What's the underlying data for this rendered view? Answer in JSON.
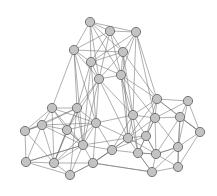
{
  "figure": {
    "kind": "node-link-graph",
    "title": "",
    "background_color": "#ffffff",
    "width": 217,
    "height": 196
  },
  "style": {
    "node_fill": "#c3c3c3",
    "node_stroke": "#6a6a6a",
    "node_radius": 4.6,
    "node_stroke_width": 0.9,
    "edge_color": "#6e6e6e",
    "edge_width": 0.55
  },
  "chart_data": {
    "type": "scatter",
    "title": "",
    "xlabel": "",
    "ylabel": "",
    "grid": false,
    "legend": "none",
    "xlim": [
      0,
      217
    ],
    "ylim": [
      0,
      196
    ],
    "node_count": 33,
    "edge_count": 128,
    "nodes": [
      {
        "id": 0,
        "x": 90,
        "y": 22
      },
      {
        "id": 1,
        "x": 110,
        "y": 31
      },
      {
        "id": 2,
        "x": 136,
        "y": 32
      },
      {
        "id": 3,
        "x": 74,
        "y": 50
      },
      {
        "id": 4,
        "x": 123,
        "y": 52
      },
      {
        "id": 5,
        "x": 91,
        "y": 62
      },
      {
        "id": 6,
        "x": 121,
        "y": 75
      },
      {
        "id": 7,
        "x": 99,
        "y": 79
      },
      {
        "id": 8,
        "x": 157,
        "y": 99
      },
      {
        "id": 9,
        "x": 188,
        "y": 101
      },
      {
        "id": 10,
        "x": 52,
        "y": 108
      },
      {
        "id": 11,
        "x": 77,
        "y": 108
      },
      {
        "id": 12,
        "x": 133,
        "y": 115
      },
      {
        "id": 13,
        "x": 180,
        "y": 117
      },
      {
        "id": 14,
        "x": 155,
        "y": 118
      },
      {
        "id": 15,
        "x": 42,
        "y": 125
      },
      {
        "id": 16,
        "x": 25,
        "y": 131
      },
      {
        "id": 17,
        "x": 96,
        "y": 123
      },
      {
        "id": 18,
        "x": 200,
        "y": 132
      },
      {
        "id": 19,
        "x": 128,
        "y": 138
      },
      {
        "id": 20,
        "x": 83,
        "y": 145
      },
      {
        "id": 21,
        "x": 156,
        "y": 154
      },
      {
        "id": 22,
        "x": 138,
        "y": 153
      },
      {
        "id": 23,
        "x": 178,
        "y": 147
      },
      {
        "id": 24,
        "x": 26,
        "y": 162
      },
      {
        "id": 25,
        "x": 54,
        "y": 163
      },
      {
        "id": 26,
        "x": 93,
        "y": 163
      },
      {
        "id": 27,
        "x": 70,
        "y": 175
      },
      {
        "id": 28,
        "x": 152,
        "y": 172
      },
      {
        "id": 29,
        "x": 178,
        "y": 167
      },
      {
        "id": 30,
        "x": 112,
        "y": 150
      },
      {
        "id": 31,
        "x": 67,
        "y": 130
      },
      {
        "id": 32,
        "x": 146,
        "y": 136
      }
    ],
    "edges": [
      [
        0,
        1
      ],
      [
        0,
        2
      ],
      [
        0,
        3
      ],
      [
        0,
        4
      ],
      [
        0,
        5
      ],
      [
        0,
        7
      ],
      [
        0,
        6
      ],
      [
        1,
        2
      ],
      [
        1,
        3
      ],
      [
        1,
        4
      ],
      [
        1,
        5
      ],
      [
        1,
        6
      ],
      [
        1,
        7
      ],
      [
        2,
        4
      ],
      [
        2,
        5
      ],
      [
        2,
        6
      ],
      [
        2,
        8
      ],
      [
        2,
        12
      ],
      [
        2,
        14
      ],
      [
        3,
        4
      ],
      [
        3,
        5
      ],
      [
        3,
        7
      ],
      [
        3,
        10
      ],
      [
        3,
        11
      ],
      [
        3,
        17
      ],
      [
        3,
        20
      ],
      [
        4,
        5
      ],
      [
        4,
        6
      ],
      [
        4,
        7
      ],
      [
        4,
        8
      ],
      [
        4,
        12
      ],
      [
        4,
        19
      ],
      [
        5,
        6
      ],
      [
        5,
        7
      ],
      [
        5,
        11
      ],
      [
        5,
        17
      ],
      [
        5,
        20
      ],
      [
        6,
        7
      ],
      [
        6,
        8
      ],
      [
        6,
        12
      ],
      [
        6,
        14
      ],
      [
        6,
        19
      ],
      [
        6,
        22
      ],
      [
        7,
        11
      ],
      [
        7,
        12
      ],
      [
        7,
        17
      ],
      [
        7,
        19
      ],
      [
        7,
        20
      ],
      [
        7,
        31
      ],
      [
        8,
        9
      ],
      [
        8,
        12
      ],
      [
        8,
        13
      ],
      [
        8,
        14
      ],
      [
        8,
        18
      ],
      [
        8,
        19
      ],
      [
        8,
        32
      ],
      [
        9,
        13
      ],
      [
        9,
        14
      ],
      [
        9,
        18
      ],
      [
        9,
        23
      ],
      [
        10,
        11
      ],
      [
        10,
        15
      ],
      [
        10,
        16
      ],
      [
        10,
        17
      ],
      [
        10,
        31
      ],
      [
        10,
        25
      ],
      [
        10,
        20
      ],
      [
        11,
        15
      ],
      [
        11,
        16
      ],
      [
        11,
        17
      ],
      [
        11,
        31
      ],
      [
        11,
        20
      ],
      [
        11,
        25
      ],
      [
        11,
        27
      ],
      [
        12,
        14
      ],
      [
        12,
        19
      ],
      [
        12,
        22
      ],
      [
        12,
        30
      ],
      [
        12,
        32
      ],
      [
        12,
        17
      ],
      [
        13,
        14
      ],
      [
        13,
        18
      ],
      [
        13,
        23
      ],
      [
        13,
        21
      ],
      [
        13,
        29
      ],
      [
        14,
        19
      ],
      [
        14,
        21
      ],
      [
        14,
        22
      ],
      [
        14,
        23
      ],
      [
        14,
        32
      ],
      [
        15,
        16
      ],
      [
        15,
        31
      ],
      [
        15,
        24
      ],
      [
        15,
        25
      ],
      [
        15,
        20
      ],
      [
        15,
        17
      ],
      [
        16,
        24
      ],
      [
        16,
        25
      ],
      [
        16,
        15
      ],
      [
        17,
        20
      ],
      [
        17,
        31
      ],
      [
        17,
        26
      ],
      [
        17,
        25
      ],
      [
        17,
        30
      ],
      [
        17,
        19
      ],
      [
        18,
        23
      ],
      [
        18,
        29
      ],
      [
        18,
        13
      ],
      [
        19,
        22
      ],
      [
        19,
        30
      ],
      [
        19,
        32
      ],
      [
        19,
        21
      ],
      [
        19,
        26
      ],
      [
        19,
        20
      ],
      [
        20,
        25
      ],
      [
        20,
        26
      ],
      [
        20,
        27
      ],
      [
        20,
        31
      ],
      [
        20,
        24
      ],
      [
        20,
        30
      ],
      [
        21,
        22
      ],
      [
        21,
        23
      ],
      [
        21,
        28
      ],
      [
        21,
        29
      ],
      [
        21,
        32
      ],
      [
        22,
        28
      ],
      [
        22,
        30
      ],
      [
        22,
        32
      ],
      [
        22,
        21
      ],
      [
        23,
        29
      ],
      [
        23,
        28
      ],
      [
        23,
        21
      ],
      [
        24,
        25
      ],
      [
        24,
        27
      ],
      [
        24,
        20
      ],
      [
        25,
        27
      ],
      [
        25,
        26
      ],
      [
        25,
        31
      ],
      [
        26,
        27
      ],
      [
        26,
        30
      ],
      [
        26,
        28
      ],
      [
        27,
        26
      ],
      [
        28,
        29
      ],
      [
        28,
        26
      ],
      [
        28,
        22
      ],
      [
        30,
        32
      ],
      [
        30,
        26
      ],
      [
        31,
        25
      ],
      [
        31,
        20
      ],
      [
        32,
        21
      ]
    ]
  }
}
